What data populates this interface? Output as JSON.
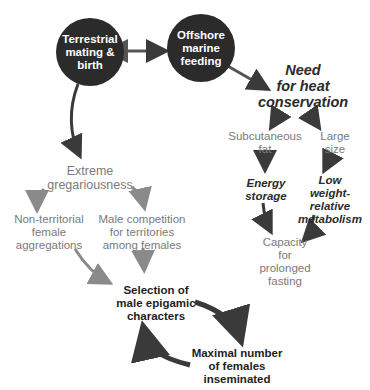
{
  "nodes": {
    "terrestrial": "Terrestrial\nmating &\nbirth",
    "offshore": "Offshore\nmarine\nfeeding",
    "heat": "Need\nfor heat\nconservation",
    "subcutaneous": "Subcutaneous\nfat",
    "large_size": "Large\nsize",
    "energy_storage": "Energy\nstorage",
    "low_metabolism": "Low\nweight-relative\nmetabolism",
    "fasting": "Capacity\nfor\nprolonged\nfasting",
    "gregariousness": "Extreme\ngregariousness",
    "non_territorial": "Non-territorial\nfemale\naggregations",
    "male_competition": "Male competition\nfor territories\namong females",
    "selection": "Selection of\nmale epigamic\ncharacters",
    "maximal": "Maximal number\nof females\ninseminated"
  },
  "colors": {
    "circle": "#2b2b2b",
    "dark_arrow": "#3a3a3a",
    "grey_arrow": "#8a8a8a",
    "grey_text": "#7a7a7a"
  }
}
